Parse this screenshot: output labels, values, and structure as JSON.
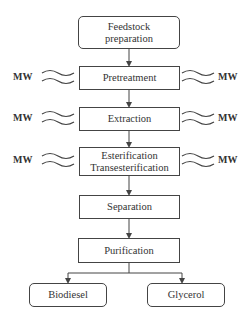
{
  "diagram": {
    "type": "process-flowchart",
    "start": {
      "label_line1": "Feedstock",
      "label_line2": "preparation",
      "shape": "rounded-rectangle"
    },
    "steps": [
      {
        "id": "pretreatment",
        "label": "Pretreatment",
        "microwave": true
      },
      {
        "id": "extraction",
        "label": "Extraction",
        "microwave": true
      },
      {
        "id": "esterification",
        "label_line1": "Esterification",
        "label_line2": "Transesterification",
        "microwave": true
      },
      {
        "id": "separation",
        "label": "Separation",
        "microwave": false
      },
      {
        "id": "purification",
        "label": "Purification",
        "microwave": false
      }
    ],
    "outputs": [
      {
        "id": "biodiesel",
        "label": "Biodiesel",
        "shape": "rounded-rectangle"
      },
      {
        "id": "glycerol",
        "label": "Glycerol",
        "shape": "rounded-rectangle"
      }
    ],
    "microwave_label": "MW",
    "colors": {
      "line": "#444444",
      "text": "#333333",
      "background": "#ffffff"
    }
  }
}
